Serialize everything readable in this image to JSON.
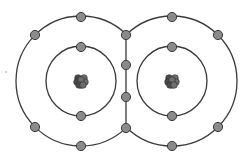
{
  "diagram": {
    "type": "covalent-bond-electron-shell",
    "colors": {
      "background": "#ffffff",
      "shell_stroke": "#3a3a3a",
      "electron_fill": "#8a8a8a",
      "electron_stroke": "#3a3a3a",
      "nucleus_fill": "#4a4a4a",
      "nucleus_highlight": "#6e6e6e"
    },
    "atoms": [
      {
        "name": "left-atom",
        "center": [
          81,
          81
        ],
        "inner_radius": 35,
        "outer_radius": 65,
        "inner_electrons": [
          [
            81,
            47
          ],
          [
            81,
            116
          ]
        ],
        "outer_electrons": [
          [
            81,
            17
          ],
          [
            35,
            35
          ],
          [
            35,
            127
          ],
          [
            81,
            146
          ]
        ]
      },
      {
        "name": "right-atom",
        "center": [
          172,
          81
        ],
        "inner_radius": 35,
        "outer_radius": 65,
        "inner_electrons": [
          [
            172,
            47
          ],
          [
            172,
            116
          ]
        ],
        "outer_electrons": [
          [
            172,
            17
          ],
          [
            218,
            35
          ],
          [
            218,
            127
          ],
          [
            172,
            146
          ]
        ]
      }
    ],
    "shared_bond": {
      "x": 126,
      "y_top": 35,
      "y_bottom": 128,
      "electrons": [
        [
          126,
          35
        ],
        [
          126,
          65
        ],
        [
          126,
          97
        ],
        [
          126,
          128
        ]
      ]
    },
    "stray_mark": [
      6,
      72
    ]
  }
}
